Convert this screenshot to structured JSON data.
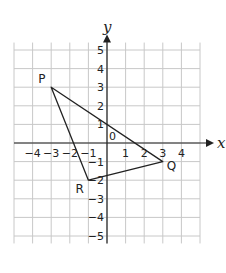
{
  "diagram": {
    "type": "coordinate-grid-triangle",
    "axes": {
      "x_label": "x",
      "y_label": "y",
      "x_range": [
        -5,
        5
      ],
      "y_range": [
        -6,
        6
      ],
      "x_ticks": [
        "−4",
        "−3",
        "−2",
        "−1",
        "1",
        "2",
        "3",
        "4"
      ],
      "y_ticks": [
        "5",
        "4",
        "3",
        "2",
        "1",
        "−1",
        "−2",
        "−3",
        "−4",
        "−5"
      ],
      "origin_label": "0"
    },
    "points": [
      {
        "label": "P",
        "x": -3,
        "y": 3
      },
      {
        "label": "Q",
        "x": 3,
        "y": -1
      },
      {
        "label": "R",
        "x": -1,
        "y": -2
      }
    ],
    "colors": {
      "grid": "#c8c8c8",
      "ink": "#222222"
    }
  }
}
